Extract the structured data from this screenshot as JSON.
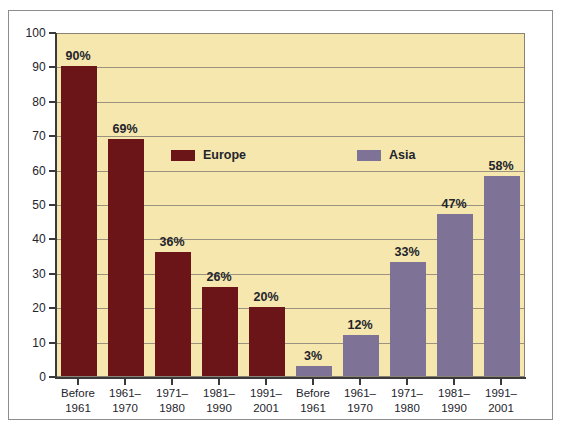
{
  "chart_data": {
    "type": "bar",
    "title": "",
    "xlabel": "",
    "ylabel": "",
    "ylim": [
      0,
      100
    ],
    "grid": true,
    "legend_position": "inside-upper-center",
    "categories": [
      "Before 1961",
      "1961–1970",
      "1971–1980",
      "1981–1990",
      "1991–2001"
    ],
    "series": [
      {
        "name": "Europe",
        "color": "#6b1518",
        "values": [
          90,
          69,
          36,
          26,
          20
        ],
        "value_labels": [
          "90%",
          "69%",
          "36%",
          "26%",
          "20%"
        ]
      },
      {
        "name": "Asia",
        "color": "#7e7296",
        "values": [
          3,
          12,
          33,
          47,
          58
        ],
        "value_labels": [
          "3%",
          "12%",
          "33%",
          "47%",
          "58%"
        ]
      }
    ],
    "y_ticks": [
      0,
      10,
      20,
      30,
      40,
      50,
      60,
      70,
      80,
      90,
      100
    ],
    "y_tick_labels": [
      "0",
      "10",
      "20",
      "30",
      "40",
      "50",
      "60",
      "70",
      "80",
      "90",
      "100"
    ],
    "x_tick_labels": [
      {
        "line1": "Before",
        "line2": "1961"
      },
      {
        "line1": "1961–",
        "line2": "1970"
      },
      {
        "line1": "1971–",
        "line2": "1980"
      },
      {
        "line1": "1981–",
        "line2": "1990"
      },
      {
        "line1": "1991–",
        "line2": "2001"
      },
      {
        "line1": "Before",
        "line2": "1961"
      },
      {
        "line1": "1961–",
        "line2": "1970"
      },
      {
        "line1": "1971–",
        "line2": "1980"
      },
      {
        "line1": "1981–",
        "line2": "1990"
      },
      {
        "line1": "1991–",
        "line2": "2001"
      }
    ],
    "bars": [
      {
        "group": "Europe",
        "category": "Before 1961",
        "value": 90,
        "label": "90%"
      },
      {
        "group": "Europe",
        "category": "1961–1970",
        "value": 69,
        "label": "69%"
      },
      {
        "group": "Europe",
        "category": "1971–1980",
        "value": 36,
        "label": "36%"
      },
      {
        "group": "Europe",
        "category": "1981–1990",
        "value": 26,
        "label": "26%"
      },
      {
        "group": "Europe",
        "category": "1991–2001",
        "value": 20,
        "label": "20%"
      },
      {
        "group": "Asia",
        "category": "Before 1961",
        "value": 3,
        "label": "3%"
      },
      {
        "group": "Asia",
        "category": "1961–1970",
        "value": 12,
        "label": "12%"
      },
      {
        "group": "Asia",
        "category": "1971–1980",
        "value": 33,
        "label": "33%"
      },
      {
        "group": "Asia",
        "category": "1981–1990",
        "value": 47,
        "label": "47%"
      },
      {
        "group": "Asia",
        "category": "1991–2001",
        "value": 58,
        "label": "58%"
      }
    ]
  },
  "legend": {
    "items": [
      {
        "label": "Europe",
        "color": "#6b1518"
      },
      {
        "label": "Asia",
        "color": "#7e7296"
      }
    ]
  },
  "colors": {
    "plot_background": "#f6e7ae",
    "europe": "#6b1518",
    "asia": "#7e7296",
    "gridline": "#8a8276",
    "axis": "#3a3a3a",
    "text": "#23242c",
    "page_background": "#ffffff",
    "frame_border": "#8d8d8d"
  }
}
